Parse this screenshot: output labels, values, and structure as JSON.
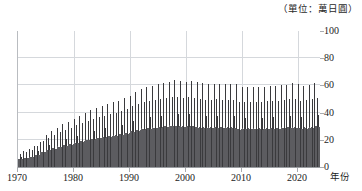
{
  "chart_data": {
    "type": "bar",
    "title": "",
    "unit_note": "（單位：萬日圓）",
    "xlabel": "年份",
    "ylabel": "",
    "xlim": [
      1970,
      2023.92
    ],
    "ylim": [
      0,
      100
    ],
    "grid": true,
    "legend": "none",
    "series_name": "每月現金給與總額",
    "x_ticks": [
      {
        "value": 1970,
        "label": "1970"
      },
      {
        "value": 1980,
        "label": "1980"
      },
      {
        "value": 1990,
        "label": "1990"
      },
      {
        "value": 2000,
        "label": "2000"
      },
      {
        "value": 2010,
        "label": "2010"
      },
      {
        "value": 2020,
        "label": "2020"
      }
    ],
    "y_ticks": [
      {
        "value": 0,
        "label": "0"
      },
      {
        "value": 20,
        "label": "20"
      },
      {
        "value": 40,
        "label": "40"
      },
      {
        "value": 60,
        "label": "60"
      },
      {
        "value": 80,
        "label": "80"
      },
      {
        "value": 100,
        "label": "100"
      }
    ],
    "bar_color": "#4a4a4d",
    "grid_color": "#d5d8dc",
    "axis_color": "#9a9da1",
    "note": "月次資料；每年6月與12月因獎金出現高峰",
    "monthly_pattern": {
      "description": "12 values per year as multipliers of that year's baseline; June and December are bonus spikes",
      "multipliers": [
        1.02,
        0.98,
        1.0,
        1.01,
        1.0,
        1.72,
        1.3,
        0.99,
        0.98,
        1.0,
        1.0,
        2.12
      ]
    },
    "yearly_baseline": [
      {
        "year": 1970,
        "value": 5.6
      },
      {
        "year": 1971,
        "value": 6.4
      },
      {
        "year": 1972,
        "value": 7.3
      },
      {
        "year": 1973,
        "value": 8.8
      },
      {
        "year": 1974,
        "value": 11.0
      },
      {
        "year": 1975,
        "value": 12.4
      },
      {
        "year": 1976,
        "value": 13.6
      },
      {
        "year": 1977,
        "value": 14.8
      },
      {
        "year": 1978,
        "value": 15.7
      },
      {
        "year": 1979,
        "value": 16.6
      },
      {
        "year": 1980,
        "value": 17.8
      },
      {
        "year": 1981,
        "value": 18.8
      },
      {
        "year": 1982,
        "value": 19.7
      },
      {
        "year": 1983,
        "value": 20.4
      },
      {
        "year": 1984,
        "value": 21.2
      },
      {
        "year": 1985,
        "value": 21.9
      },
      {
        "year": 1986,
        "value": 22.5
      },
      {
        "year": 1987,
        "value": 23.0
      },
      {
        "year": 1988,
        "value": 23.8
      },
      {
        "year": 1989,
        "value": 24.8
      },
      {
        "year": 1990,
        "value": 25.9
      },
      {
        "year": 1991,
        "value": 27.0
      },
      {
        "year": 1992,
        "value": 27.8
      },
      {
        "year": 1993,
        "value": 28.2
      },
      {
        "year": 1994,
        "value": 28.7
      },
      {
        "year": 1995,
        "value": 29.1
      },
      {
        "year": 1996,
        "value": 29.6
      },
      {
        "year": 1997,
        "value": 30.1
      },
      {
        "year": 1998,
        "value": 29.9
      },
      {
        "year": 1999,
        "value": 29.6
      },
      {
        "year": 2000,
        "value": 29.8
      },
      {
        "year": 2001,
        "value": 29.5
      },
      {
        "year": 2002,
        "value": 29.0
      },
      {
        "year": 2003,
        "value": 28.7
      },
      {
        "year": 2004,
        "value": 28.8
      },
      {
        "year": 2005,
        "value": 28.9
      },
      {
        "year": 2006,
        "value": 28.8
      },
      {
        "year": 2007,
        "value": 28.8
      },
      {
        "year": 2008,
        "value": 28.7
      },
      {
        "year": 2009,
        "value": 27.6
      },
      {
        "year": 2010,
        "value": 27.9
      },
      {
        "year": 2011,
        "value": 27.9
      },
      {
        "year": 2012,
        "value": 27.8
      },
      {
        "year": 2013,
        "value": 27.8
      },
      {
        "year": 2014,
        "value": 28.1
      },
      {
        "year": 2015,
        "value": 28.1
      },
      {
        "year": 2016,
        "value": 28.3
      },
      {
        "year": 2017,
        "value": 28.5
      },
      {
        "year": 2018,
        "value": 29.0
      },
      {
        "year": 2019,
        "value": 28.9
      },
      {
        "year": 2020,
        "value": 28.2
      },
      {
        "year": 2021,
        "value": 28.5
      },
      {
        "year": 2022,
        "value": 29.0
      },
      {
        "year": 2023,
        "value": 29.6
      }
    ],
    "peak_values": [
      {
        "year": 1993,
        "month": 12,
        "value": 86.0
      },
      {
        "year": 1997,
        "month": 12,
        "value": 87.5
      },
      {
        "year": 1998,
        "month": 12,
        "value": 85.0
      },
      {
        "year": 2023,
        "month": 12,
        "value": 65.0
      }
    ]
  }
}
